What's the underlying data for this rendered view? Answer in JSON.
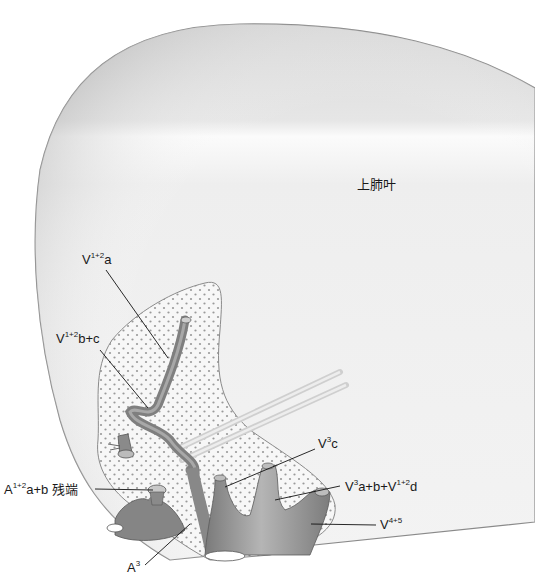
{
  "diagram": {
    "title": "",
    "lobe_label": "上肺叶",
    "colors": {
      "lung_fill": "#ebebeb",
      "lung_edge": "#8a8a8a",
      "hilum_fill": "#f4f4f4",
      "dots": "#9a9a9a",
      "vessel": "#8c8c8c",
      "vessel_dark": "#6e6e6e",
      "tape": "#d8d8d8",
      "leader": "#111111"
    },
    "labels": [
      {
        "id": "v12a",
        "base": "V",
        "sup": "1+2",
        "rest": "a"
      },
      {
        "id": "v12bc",
        "base": "V",
        "sup": "1+2",
        "rest": "b+c"
      },
      {
        "id": "a12ab",
        "base": "A",
        "sup": "1+2",
        "rest": "a+b 残端"
      },
      {
        "id": "a3",
        "base": "A",
        "sup": "3",
        "rest": ""
      },
      {
        "id": "v3c",
        "base": "V",
        "sup": "3",
        "rest": "c"
      },
      {
        "id": "v3ab",
        "base": "V",
        "sup": "3",
        "rest": "a+b+V",
        "sup2": "1+2",
        "rest2": "d"
      },
      {
        "id": "v45",
        "base": "V",
        "sup": "4+5",
        "rest": ""
      }
    ]
  }
}
